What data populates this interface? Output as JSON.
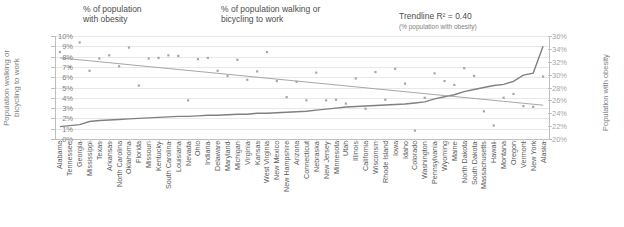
{
  "legend": {
    "obesity": {
      "label": "% of population\nwith obesity",
      "marker": "dot",
      "color": "#a6a6a6"
    },
    "walking": {
      "label": "% of population walking or\nbicycling to work",
      "marker": "line",
      "color": "#808080"
    },
    "trendline": {
      "label": "Trendline R² = 0.40",
      "sublabel": "(% population with obesity)",
      "marker": "line",
      "color": "#a6a6a6"
    }
  },
  "axes": {
    "left_title": "Population walking or\nbicycling to work",
    "right_title": "Population with obesity",
    "left_ticks": [
      "10%",
      "9%",
      "8%",
      "7%",
      "6%",
      "5%",
      "4%",
      "3%",
      "2%",
      "1%",
      "0%"
    ],
    "right_ticks": [
      "36%",
      "34%",
      "32%",
      "30%",
      "28%",
      "26%",
      "24%",
      "22%",
      "20%"
    ]
  },
  "chart_data": {
    "type": "scatter",
    "title": "",
    "xlabel": "",
    "ylabel": "Population walking or bicycling to work",
    "y2label": "Population with obesity",
    "ylim": [
      0,
      10
    ],
    "y2lim": [
      20,
      36
    ],
    "grid": true,
    "legend_position": "top",
    "categories": [
      "Alabama",
      "Tennessee",
      "Georgia",
      "Mississippi",
      "Texas",
      "Arkansas",
      "North Carolina",
      "Oklahoma",
      "Florida",
      "Missouri",
      "Kentucky",
      "South Carolina",
      "Louisiana",
      "Nevada",
      "Ohio",
      "Indiana",
      "Delaware",
      "Maryland",
      "Michigan",
      "Virginia",
      "Kansas",
      "West Virginia",
      "New Mexico",
      "New Hampshire",
      "Arizona",
      "Connecticut",
      "Nebraska",
      "New Jersey",
      "Minnesota",
      "Utah",
      "Illinois",
      "California",
      "Wisconsin",
      "Rhode Island",
      "Iowa",
      "Idaho",
      "Colorado",
      "Washington",
      "Pennsylvania",
      "Wyoming",
      "Maine",
      "North Dakota",
      "South Dakota",
      "Massachusetts",
      "Hawaii",
      "Montana",
      "Oregon",
      "Vermont",
      "New York",
      "Alaska"
    ],
    "series": [
      {
        "name": "% of population with obesity",
        "type": "scatter",
        "axis": "right",
        "unit": "%",
        "values": [
          33.5,
          31.2,
          35.0,
          30.6,
          32.5,
          33.0,
          31.3,
          34.2,
          28.3,
          32.5,
          32.6,
          33.0,
          32.9,
          26.0,
          32.4,
          32.6,
          30.6,
          29.8,
          32.3,
          29.2,
          30.5,
          33.5,
          29.0,
          26.5,
          28.9,
          26.0,
          30.3,
          26.0,
          26.1,
          25.5,
          29.4,
          24.7,
          30.4,
          26.1,
          30.9,
          28.6,
          21.3,
          26.4,
          30.2,
          29.0,
          28.4,
          31.0,
          29.8,
          24.3,
          22.1,
          26.4,
          27.0,
          25.1,
          25.0,
          29.7
        ]
      },
      {
        "name": "% of population walking or bicycling to work",
        "type": "line",
        "axis": "left",
        "unit": "%",
        "values": [
          1.2,
          1.3,
          1.4,
          1.7,
          1.8,
          1.85,
          1.9,
          1.95,
          2.0,
          2.05,
          2.1,
          2.15,
          2.2,
          2.2,
          2.25,
          2.3,
          2.3,
          2.35,
          2.4,
          2.4,
          2.5,
          2.5,
          2.55,
          2.6,
          2.65,
          2.7,
          2.8,
          2.9,
          3.0,
          3.1,
          3.15,
          3.2,
          3.25,
          3.3,
          3.35,
          3.4,
          3.5,
          3.6,
          3.9,
          4.1,
          4.3,
          4.6,
          4.8,
          5.0,
          5.2,
          5.3,
          5.6,
          6.2,
          6.4,
          9.0
        ]
      },
      {
        "name": "Trendline R² = 0.40",
        "type": "line",
        "axis": "right",
        "unit": "%",
        "r_squared": 0.4,
        "values": [
          32.6,
          32.45,
          32.3,
          32.15,
          32.0,
          31.85,
          31.7,
          31.55,
          31.4,
          31.25,
          31.1,
          30.95,
          30.8,
          30.65,
          30.5,
          30.35,
          30.2,
          30.05,
          29.9,
          29.75,
          29.6,
          29.45,
          29.3,
          29.15,
          29.0,
          28.85,
          28.7,
          28.55,
          28.4,
          28.25,
          28.1,
          27.95,
          27.8,
          27.65,
          27.5,
          27.35,
          27.2,
          27.05,
          26.9,
          26.75,
          26.6,
          26.45,
          26.3,
          26.15,
          26.0,
          25.85,
          25.7,
          25.55,
          25.4,
          25.25
        ]
      }
    ]
  }
}
